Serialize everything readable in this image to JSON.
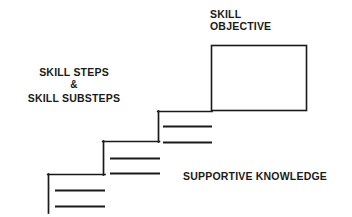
{
  "diagram": {
    "background_color": "#ffffff",
    "stroke_color": "#1a1a1a",
    "text_color": "#1a1a1a",
    "labels": {
      "skill_objective": {
        "line1": "SKILL",
        "line2": "OBJECTIVE"
      },
      "skill_steps": {
        "line1": "SKILL STEPS",
        "connector": "&",
        "line2": "SKILL SUBSTEPS"
      },
      "supportive_knowledge": "SUPPORTIVE KNOWLEDGE"
    },
    "shapes": {
      "objective_box": {
        "x": 211,
        "y": 45,
        "width": 96,
        "height": 66
      },
      "staircase": {
        "step_count": 3,
        "steps": [
          {
            "name": "bottom-step",
            "riser_x": 48,
            "riser_y_top": 174,
            "riser_y_bottom": 213,
            "tread_y": 174,
            "tread_x_start": 48,
            "tread_x_end": 105,
            "sublines": [
              {
                "y": 190,
                "x_start": 55,
                "x_end": 105
              },
              {
                "y": 206,
                "x_start": 55,
                "x_end": 105
              }
            ]
          },
          {
            "name": "middle-step",
            "riser_x": 103,
            "riser_y_top": 141,
            "riser_y_bottom": 175,
            "tread_y": 141,
            "tread_x_start": 103,
            "tread_x_end": 159,
            "sublines": [
              {
                "y": 158,
                "x_start": 110,
                "x_end": 160
              },
              {
                "y": 173,
                "x_start": 110,
                "x_end": 160
              }
            ]
          },
          {
            "name": "top-step",
            "riser_x": 158,
            "riser_y_top": 111,
            "riser_y_bottom": 142,
            "tread_y": 111,
            "tread_x_start": 158,
            "tread_x_end": 212,
            "sublines": [
              {
                "y": 126,
                "x_start": 163,
                "x_end": 212
              },
              {
                "y": 142,
                "x_start": 163,
                "x_end": 212
              }
            ]
          }
        ]
      }
    }
  }
}
